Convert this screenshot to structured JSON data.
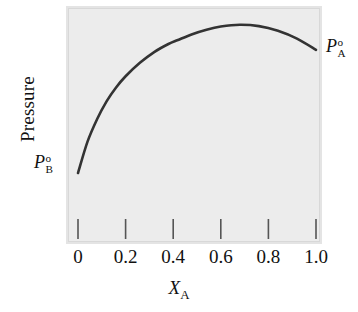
{
  "chart_data": {
    "type": "line",
    "title": "",
    "subtitle": "",
    "xlabel": "X",
    "xlabel_sub": "A",
    "ylabel": "Pressure",
    "xlim": [
      0,
      1.0
    ],
    "ylim": [
      0,
      1.0
    ],
    "grid": false,
    "legend": "none",
    "xticks": [
      {
        "value": 0,
        "label": "0"
      },
      {
        "value": 0.2,
        "label": "0.2"
      },
      {
        "value": 0.4,
        "label": "0.4"
      },
      {
        "value": 0.6,
        "label": "0.6"
      },
      {
        "value": 0.8,
        "label": "0.8"
      },
      {
        "value": 1.0,
        "label": "1.0"
      }
    ],
    "yticks": [],
    "series": [
      {
        "name": "total vapour pressure",
        "color": "#333333",
        "x": [
          0.0,
          0.04,
          0.08,
          0.12,
          0.16,
          0.2,
          0.26,
          0.32,
          0.38,
          0.42,
          0.48,
          0.54,
          0.6,
          0.68,
          0.76,
          0.84,
          0.92,
          1.0
        ],
        "y": [
          0.29,
          0.43,
          0.53,
          0.61,
          0.672,
          0.722,
          0.782,
          0.83,
          0.866,
          0.884,
          0.91,
          0.93,
          0.944,
          0.952,
          0.946,
          0.925,
          0.89,
          0.84
        ]
      }
    ],
    "annotations": [
      {
        "name": "p-b-standard",
        "base": "P",
        "superscript": "o",
        "subscript": "B",
        "at_x": 0.0,
        "position": "left-of-curve-start"
      },
      {
        "name": "p-a-standard",
        "base": "P",
        "superscript": "o",
        "subscript": "A",
        "at_x": 1.0,
        "position": "right-of-curve-end"
      }
    ],
    "colors": {
      "curve": "#333333",
      "plot_background": "#ececec",
      "frame": "#d8d8d8",
      "bevel": "#e4e4e4",
      "page_background": "#ffffff",
      "text": "#111111",
      "tick": "#555555"
    }
  }
}
